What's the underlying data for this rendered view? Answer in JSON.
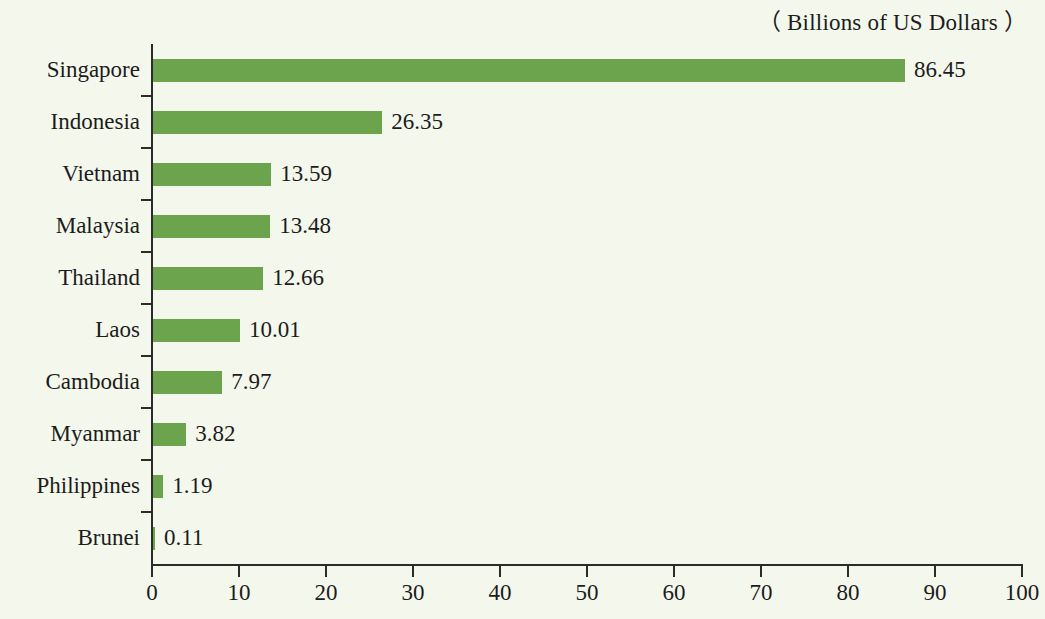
{
  "chart_data": {
    "type": "bar",
    "orientation": "horizontal",
    "title": "（ Billions of US Dollars ）",
    "xlabel": "",
    "ylabel": "",
    "xlim": [
      0,
      100
    ],
    "xticks": [
      0,
      10,
      20,
      30,
      40,
      50,
      60,
      70,
      80,
      90,
      100
    ],
    "grid": false,
    "legend": null,
    "bar_color": "#6ca44e",
    "background_color": "#f4f7ec",
    "text_color": "#1c1c1c",
    "categories": [
      "Singapore",
      "Indonesia",
      "Vietnam",
      "Malaysia",
      "Thailand",
      "Laos",
      "Cambodia",
      "Myanmar",
      "Philippines",
      "Brunei"
    ],
    "values": [
      86.45,
      26.35,
      13.59,
      13.48,
      12.66,
      10.01,
      7.97,
      3.82,
      1.19,
      0.11
    ],
    "value_labels": [
      "86.45",
      "26.35",
      "13.59",
      "13.48",
      "12.66",
      "10.01",
      "7.97",
      "3.82",
      "1.19",
      "0.11"
    ],
    "xtick_labels": [
      "0",
      "10",
      "20",
      "30",
      "40",
      "50",
      "60",
      "70",
      "80",
      "90",
      "100"
    ]
  }
}
